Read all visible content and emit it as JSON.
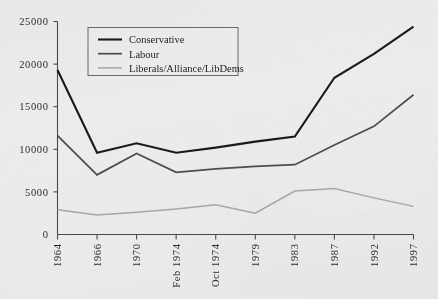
{
  "chart_data": {
    "type": "line",
    "title": "",
    "subtitle": "",
    "xlabel": "",
    "ylabel": "",
    "grid": false,
    "legend_position": "top-left",
    "categories": [
      "1964",
      "1966",
      "1970",
      "Feb 1974",
      "Oct 1974",
      "1979",
      "1983",
      "1987",
      "1992",
      "1997"
    ],
    "ylim": [
      0,
      25000
    ],
    "yticks": [
      0,
      5000,
      10000,
      15000,
      20000,
      25000
    ],
    "ytick_labels": [
      "0",
      "5000",
      "10000",
      "15000",
      "20000",
      "25000"
    ],
    "series": [
      {
        "name": "Conservative",
        "color": "#1a1a1a",
        "width": 2.1,
        "values": [
          19300,
          9600,
          10700,
          9600,
          10200,
          10900,
          11500,
          18400,
          21200,
          24400
        ]
      },
      {
        "name": "Labour",
        "color": "#4d4d4d",
        "width": 1.7,
        "values": [
          11600,
          7000,
          9500,
          7300,
          7700,
          8000,
          8200,
          10500,
          12700,
          16400
        ]
      },
      {
        "name": "Liberals/Alliance/LibDems",
        "color": "#a8a8a8",
        "width": 1.5,
        "values": [
          2900,
          2300,
          2600,
          3000,
          3500,
          2500,
          5100,
          5400,
          4300,
          3300
        ]
      }
    ]
  },
  "legend": {
    "items": [
      {
        "label": "Conservative"
      },
      {
        "label": "Labour"
      },
      {
        "label": "Liberals/Alliance/LibDems"
      }
    ]
  }
}
